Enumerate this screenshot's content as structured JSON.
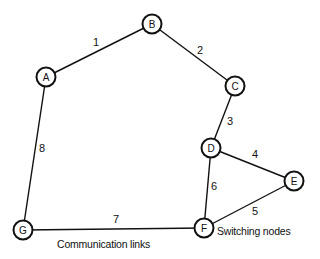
{
  "diagram": {
    "nodes": [
      {
        "id": "A",
        "label": "A",
        "x": 46,
        "y": 77
      },
      {
        "id": "B",
        "label": "B",
        "x": 152,
        "y": 24
      },
      {
        "id": "C",
        "label": "C",
        "x": 235,
        "y": 86
      },
      {
        "id": "D",
        "label": "D",
        "x": 211,
        "y": 148
      },
      {
        "id": "E",
        "label": "E",
        "x": 294,
        "y": 181
      },
      {
        "id": "F",
        "label": "F",
        "x": 204,
        "y": 228
      },
      {
        "id": "G",
        "label": "G",
        "x": 23,
        "y": 230
      }
    ],
    "links": [
      {
        "id": "1",
        "label": "1",
        "from": "A",
        "to": "B",
        "lx": 96,
        "ly": 42
      },
      {
        "id": "2",
        "label": "2",
        "from": "B",
        "to": "C",
        "lx": 200,
        "ly": 50
      },
      {
        "id": "3",
        "label": "3",
        "from": "C",
        "to": "D",
        "lx": 230,
        "ly": 121
      },
      {
        "id": "4",
        "label": "4",
        "from": "D",
        "to": "E",
        "lx": 255,
        "ly": 154
      },
      {
        "id": "5",
        "label": "5",
        "from": "E",
        "to": "F",
        "lx": 255,
        "ly": 211
      },
      {
        "id": "6",
        "label": "6",
        "from": "D",
        "to": "F",
        "lx": 214,
        "ly": 186
      },
      {
        "id": "7",
        "label": "7",
        "from": "G",
        "to": "F",
        "lx": 116,
        "ly": 219
      },
      {
        "id": "8",
        "label": "8",
        "from": "A",
        "to": "G",
        "lx": 42,
        "ly": 148
      }
    ],
    "captions": {
      "links": "Communication links",
      "nodes": "Switching nodes"
    }
  }
}
